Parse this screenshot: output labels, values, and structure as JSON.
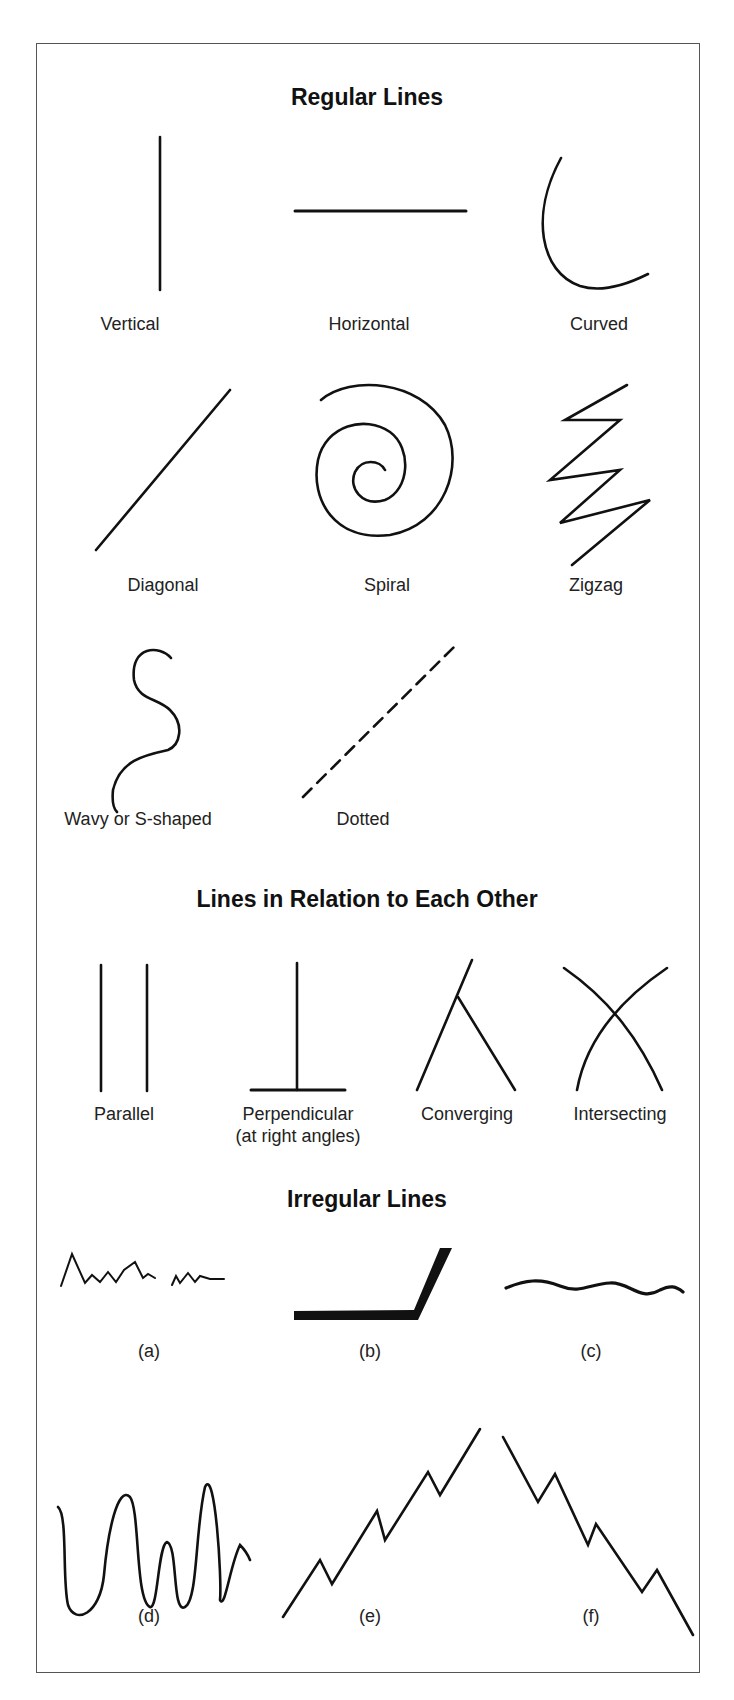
{
  "sections": {
    "regular": {
      "title": "Regular Lines",
      "items": [
        {
          "id": "vertical",
          "label": "Vertical"
        },
        {
          "id": "horizontal",
          "label": "Horizontal"
        },
        {
          "id": "curved",
          "label": "Curved"
        },
        {
          "id": "diagonal",
          "label": "Diagonal"
        },
        {
          "id": "spiral",
          "label": "Spiral"
        },
        {
          "id": "zigzag",
          "label": "Zigzag"
        },
        {
          "id": "wavy",
          "label": "Wavy or S-shaped"
        },
        {
          "id": "dotted",
          "label": "Dotted"
        }
      ]
    },
    "relation": {
      "title": "Lines in Relation to Each Other",
      "items": [
        {
          "id": "parallel",
          "label": "Parallel"
        },
        {
          "id": "perpendicular",
          "label": "Perpendicular",
          "sublabel": "(at right angles)"
        },
        {
          "id": "converging",
          "label": "Converging"
        },
        {
          "id": "intersecting",
          "label": "Intersecting"
        }
      ]
    },
    "irregular": {
      "title": "Irregular Lines",
      "items": [
        {
          "id": "a",
          "label": "(a)"
        },
        {
          "id": "b",
          "label": "(b)"
        },
        {
          "id": "c",
          "label": "(c)"
        },
        {
          "id": "d",
          "label": "(d)"
        },
        {
          "id": "e",
          "label": "(e)"
        },
        {
          "id": "f",
          "label": "(f)"
        }
      ]
    }
  },
  "colors": {
    "stroke": "#111111",
    "frame": "#555555",
    "background": "#ffffff"
  }
}
